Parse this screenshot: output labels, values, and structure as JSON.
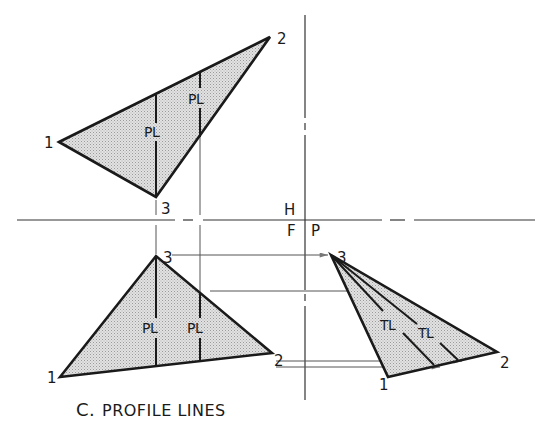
{
  "figure": {
    "caption_prefix": "C.",
    "caption": "PROFILE LINES",
    "colors": {
      "ink": "#1a1a1a",
      "fill": "#d9d9d9",
      "projection": "#555555",
      "background": "#ffffff"
    }
  },
  "fold_lines": {
    "horizontal": {
      "y": 220,
      "label_above": "H",
      "label_below_left": "F"
    },
    "vertical": {
      "x": 305,
      "label_right": "P"
    }
  },
  "views": {
    "top": {
      "name": "Horizontal view",
      "vertices": [
        {
          "label": "1",
          "x": 59,
          "y": 142
        },
        {
          "label": "2",
          "x": 270,
          "y": 37
        },
        {
          "label": "3",
          "x": 156,
          "y": 197
        }
      ],
      "lines": [
        {
          "label": "PL"
        },
        {
          "label": "PL"
        }
      ],
      "vertex_3_label_below": "3"
    },
    "front": {
      "name": "Frontal view",
      "vertices": [
        {
          "label": "1",
          "x": 60,
          "y": 377
        },
        {
          "label": "2",
          "x": 272,
          "y": 353
        },
        {
          "label": "3",
          "x": 156,
          "y": 256
        }
      ],
      "lines": [
        {
          "label": "PL"
        },
        {
          "label": "PL"
        }
      ]
    },
    "profile": {
      "name": "Profile view",
      "vertices": [
        {
          "label": "1",
          "x": 388,
          "y": 377
        },
        {
          "label": "2",
          "x": 497,
          "y": 352
        },
        {
          "label": "3",
          "x": 331,
          "y": 255
        }
      ],
      "lines": [
        {
          "label": "TL"
        },
        {
          "label": "TL"
        }
      ]
    }
  }
}
